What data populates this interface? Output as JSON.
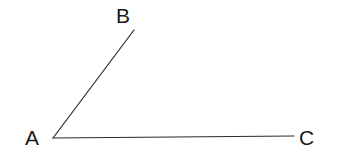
{
  "figure": {
    "kind": "geometry-angle-diagram",
    "background_color": "#ffffff",
    "stroke_color": "#2b2b2b",
    "label_color": "#1a1a1a",
    "stroke_width": 1.2,
    "canvas": {
      "width": 340,
      "height": 158
    },
    "points": {
      "A": {
        "label": "A",
        "x": 53,
        "y": 138,
        "label_x": 25,
        "label_y": 127
      },
      "B": {
        "label": "B",
        "x": 134,
        "y": 30,
        "label_x": 116,
        "label_y": 5
      },
      "C": {
        "label": "C",
        "x": 294,
        "y": 136,
        "label_x": 299,
        "label_y": 127
      }
    },
    "segments": [
      {
        "name": "ray-AB",
        "from": "A",
        "to": "B"
      },
      {
        "name": "ray-AC",
        "from": "A",
        "to": "C"
      }
    ]
  }
}
